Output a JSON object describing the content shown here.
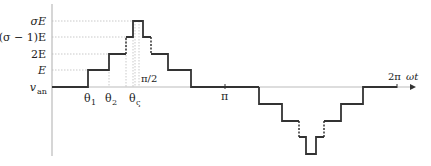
{
  "diagram": {
    "y_labels": {
      "sigmaE": "σE",
      "sigma_minus_1_E": "(σ − 1)E",
      "twoE": "2E",
      "E": "E",
      "van": "v",
      "van_sub": "an"
    },
    "x_labels": {
      "theta1": "θ",
      "theta1_sub": "1",
      "theta2": "θ",
      "theta2_sub": "2",
      "thetaS": "θ",
      "thetaS_sub": "ς",
      "pi_half": "π/2",
      "pi": "π",
      "two_pi": "2π",
      "omega_t": "ωt"
    },
    "colors": {
      "waveform": "#333333",
      "axis": "#bbbbbb",
      "guides": "#bbbbbb"
    }
  }
}
